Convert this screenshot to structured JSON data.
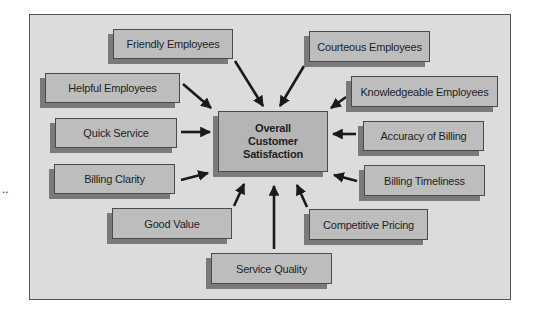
{
  "diagram": {
    "center": {
      "label": "Overall\nCustomer\nSatisfaction"
    },
    "factors": [
      {
        "id": "friendly",
        "label": "Friendly Employees"
      },
      {
        "id": "courteous",
        "label": "Courteous Employees"
      },
      {
        "id": "helpful",
        "label": "Helpful Employees"
      },
      {
        "id": "knowledgeable",
        "label": "Knowledgeable Employees"
      },
      {
        "id": "quick",
        "label": "Quick Service"
      },
      {
        "id": "accuracy",
        "label": "Accuracy of Billing"
      },
      {
        "id": "clarity",
        "label": "Billing Clarity"
      },
      {
        "id": "timeliness",
        "label": "Billing Timeliness"
      },
      {
        "id": "value",
        "label": "Good Value"
      },
      {
        "id": "pricing",
        "label": "Competitive Pricing"
      },
      {
        "id": "quality",
        "label": "Service Quality"
      }
    ],
    "edges": [
      {
        "from": "friendly",
        "to": "center"
      },
      {
        "from": "courteous",
        "to": "center"
      },
      {
        "from": "helpful",
        "to": "center"
      },
      {
        "from": "knowledgeable",
        "to": "center"
      },
      {
        "from": "quick",
        "to": "center"
      },
      {
        "from": "accuracy",
        "to": "center"
      },
      {
        "from": "clarity",
        "to": "center"
      },
      {
        "from": "timeliness",
        "to": "center"
      },
      {
        "from": "value",
        "to": "center"
      },
      {
        "from": "pricing",
        "to": "center"
      },
      {
        "from": "quality",
        "to": "center"
      }
    ],
    "margin_mark": ".."
  }
}
